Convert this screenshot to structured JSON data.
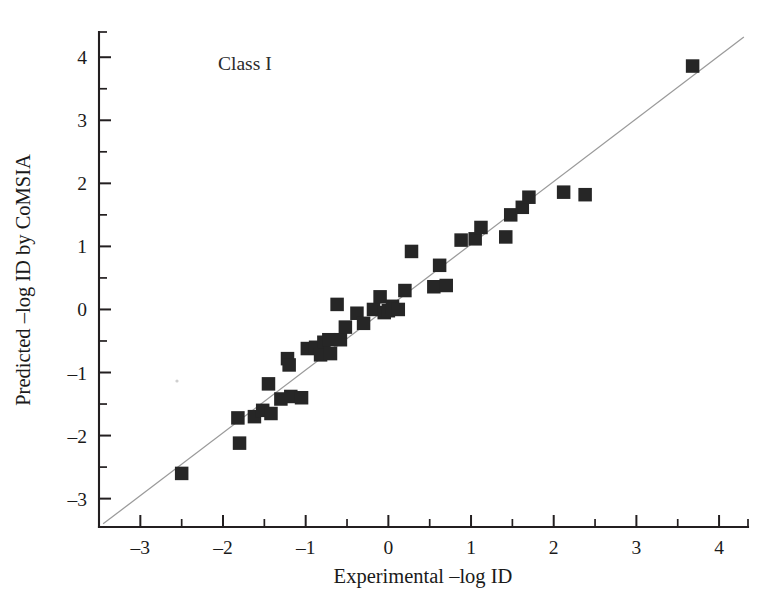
{
  "figure": {
    "background": "#ffffff",
    "marker_color": "#262626",
    "line_color": "#9a9a9a",
    "axis_color": "#231f20"
  },
  "chart_data": {
    "type": "scatter",
    "title": "",
    "annotation": "Class I",
    "xlabel": "Experimental –log ID",
    "ylabel": "Predicted –log ID by CoMSIA",
    "xlim": [
      -3.5,
      4.35
    ],
    "ylim": [
      -3.45,
      4.4
    ],
    "grid": false,
    "legend": null,
    "xticks": [
      -3,
      -2,
      -1,
      0,
      1,
      2,
      3,
      4
    ],
    "xtick_labels": [
      "–3",
      "–2",
      "–1",
      "0",
      "1",
      "2",
      "3",
      "4"
    ],
    "xticks_minor": [
      -3.5,
      -2.5,
      -1.5,
      -0.5,
      0.5,
      1.5,
      2.5,
      3.5,
      4.35
    ],
    "yticks": [
      -3,
      -2,
      -1,
      0,
      1,
      2,
      3,
      4
    ],
    "ytick_labels": [
      "–3",
      "–2",
      "–1",
      "0",
      "1",
      "2",
      "3",
      "4"
    ],
    "yticks_minor": [
      -2.5,
      -1.5,
      -0.5,
      0.5,
      1.5,
      2.5,
      3.5,
      4.4
    ],
    "series": [
      {
        "name": "CoMSIA predictions",
        "marker": "square",
        "x": [
          -2.5,
          -1.82,
          -1.8,
          -1.62,
          -1.52,
          -1.45,
          -1.42,
          -1.3,
          -1.22,
          -1.2,
          -1.18,
          -1.05,
          -0.98,
          -0.88,
          -0.82,
          -0.78,
          -0.72,
          -0.7,
          -0.62,
          -0.58,
          -0.52,
          -0.38,
          -0.3,
          -0.18,
          -0.1,
          -0.05,
          0.0,
          0.05,
          0.12,
          0.2,
          0.28,
          0.55,
          0.62,
          0.7,
          0.88,
          1.05,
          1.12,
          1.42,
          1.48,
          1.62,
          1.7,
          2.12,
          2.38,
          3.68
        ],
        "y": [
          -2.6,
          -1.72,
          -2.12,
          -1.7,
          -1.6,
          -1.18,
          -1.65,
          -1.42,
          -0.78,
          -0.88,
          -1.38,
          -1.4,
          -0.62,
          -0.6,
          -0.72,
          -0.52,
          -0.48,
          -0.7,
          0.08,
          -0.48,
          -0.28,
          -0.06,
          -0.22,
          0.0,
          0.2,
          -0.05,
          -0.02,
          0.05,
          0.0,
          0.3,
          0.92,
          0.36,
          0.7,
          0.38,
          1.1,
          1.12,
          1.3,
          1.15,
          1.5,
          1.62,
          1.78,
          1.86,
          1.82,
          3.86
        ]
      }
    ],
    "fit_line": {
      "name": "identity / regression line",
      "x": [
        -3.45,
        4.3
      ],
      "y": [
        -3.4,
        4.32
      ]
    }
  }
}
